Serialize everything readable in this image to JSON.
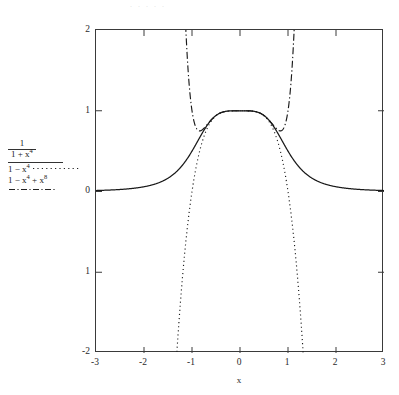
{
  "figure": {
    "top_artifact": ". .   . .  .",
    "background": "#ffffff",
    "ink_color": "#2a2a2a"
  },
  "axes": {
    "xlabel": "x",
    "ylabel": "",
    "x_ticks": [
      "-3",
      "-2",
      "-1",
      "0",
      "1",
      "2",
      "3"
    ],
    "y_ticks": [
      "2",
      "1",
      "0",
      "1",
      "-2"
    ]
  },
  "legend": {
    "entries": [
      {
        "label": "1/(1+x^4)",
        "numerator": "1",
        "denominator_base": "1 + x",
        "denominator_exp": "4",
        "linestyle": "solid",
        "color": "#1a1a1a"
      },
      {
        "label": "1 - x^4",
        "base": "1 − x",
        "exp": "4",
        "linestyle": "dotted",
        "color": "#1a1a1a"
      },
      {
        "label": "1 - x^4 + x^8",
        "base_a": "1 − x",
        "exp_a": "4",
        "base_b": " + x",
        "exp_b": "8",
        "linestyle": "dashdot",
        "color": "#1a1a1a"
      }
    ]
  },
  "chart_data": {
    "type": "line",
    "title": "",
    "xlabel": "x",
    "ylabel": "",
    "xlim": [
      -3,
      3
    ],
    "ylim": [
      -2,
      2
    ],
    "grid": false,
    "legend_position": "left-outside",
    "x_ticks": [
      -3,
      -2,
      -1,
      0,
      1,
      2,
      3
    ],
    "y_ticks": [
      -2,
      -1,
      0,
      1,
      2
    ],
    "series": [
      {
        "name": "1/(1+x^4)",
        "linestyle": "solid",
        "color": "#1a1a1a",
        "formula": "1/(1+x**4)",
        "x": [
          -3.0,
          -2.8,
          -2.6,
          -2.4,
          -2.2,
          -2.0,
          -1.8,
          -1.6,
          -1.4,
          -1.2,
          -1.0,
          -0.9,
          -0.8,
          -0.7,
          -0.6,
          -0.5,
          -0.4,
          -0.3,
          -0.2,
          -0.1,
          0.0,
          0.1,
          0.2,
          0.3,
          0.4,
          0.5,
          0.6,
          0.7,
          0.8,
          0.9,
          1.0,
          1.2,
          1.4,
          1.6,
          1.8,
          2.0,
          2.2,
          2.4,
          2.6,
          2.8,
          3.0
        ],
        "y": [
          0.0122,
          0.016,
          0.0214,
          0.0292,
          0.0407,
          0.0588,
          0.087,
          0.1323,
          0.2064,
          0.3258,
          0.5,
          0.6041,
          0.7092,
          0.8063,
          0.8853,
          0.9412,
          0.975,
          0.9919,
          0.9984,
          0.9999,
          1.0,
          0.9999,
          0.9984,
          0.9919,
          0.975,
          0.9412,
          0.8853,
          0.8063,
          0.7092,
          0.6041,
          0.5,
          0.3258,
          0.2064,
          0.1323,
          0.087,
          0.0588,
          0.0407,
          0.0292,
          0.0214,
          0.016,
          0.0122
        ]
      },
      {
        "name": "1 - x^4",
        "linestyle": "dotted",
        "color": "#1a1a1a",
        "formula": "1 - x**4",
        "x": [
          -1.32,
          -1.3,
          -1.25,
          -1.2,
          -1.15,
          -1.1,
          -1.05,
          -1.0,
          -0.9,
          -0.8,
          -0.7,
          -0.6,
          -0.5,
          -0.4,
          -0.3,
          -0.2,
          -0.1,
          0.0,
          0.1,
          0.2,
          0.3,
          0.4,
          0.5,
          0.6,
          0.7,
          0.8,
          0.9,
          1.0,
          1.05,
          1.1,
          1.15,
          1.2,
          1.25,
          1.3,
          1.32
        ],
        "y": [
          -2.0374,
          -1.8561,
          -1.4414,
          -1.0736,
          -0.749,
          -0.4641,
          -0.2155,
          0.0,
          0.3439,
          0.5904,
          0.7599,
          0.8704,
          0.9375,
          0.9744,
          0.9919,
          0.9984,
          0.9999,
          1.0,
          0.9999,
          0.9984,
          0.9919,
          0.9744,
          0.9375,
          0.8704,
          0.7599,
          0.5904,
          0.3439,
          0.0,
          -0.2155,
          -0.4641,
          -0.749,
          -1.0736,
          -1.4414,
          -1.8561,
          -2.0374
        ]
      },
      {
        "name": "1 - x^4 + x^8",
        "linestyle": "dashdot",
        "color": "#1a1a1a",
        "formula": "1 - x**4 + x**8",
        "x": [
          -1.22,
          -1.2,
          -1.18,
          -1.15,
          -1.12,
          -1.1,
          -1.05,
          -1.0,
          -0.9,
          -0.8,
          -0.7,
          -0.6,
          -0.5,
          -0.4,
          -0.3,
          -0.2,
          -0.1,
          0.0,
          0.1,
          0.2,
          0.3,
          0.4,
          0.5,
          0.6,
          0.7,
          0.8,
          0.9,
          1.0,
          1.05,
          1.1,
          1.12,
          1.15,
          1.18,
          1.2,
          1.22
        ],
        "y": [
          2.0,
          1.8378,
          1.5552,
          1.2133,
          0.996,
          0.9101,
          0.8404,
          1.0,
          0.8744,
          0.7804,
          0.8117,
          0.8871,
          0.9414,
          0.975,
          0.992,
          0.9984,
          0.9999,
          1.0,
          0.9999,
          0.9984,
          0.992,
          0.975,
          0.9414,
          0.8871,
          0.8117,
          0.7804,
          0.8744,
          1.0,
          0.8404,
          0.9101,
          0.996,
          1.2133,
          1.5552,
          1.8378,
          2.0
        ]
      }
    ]
  }
}
